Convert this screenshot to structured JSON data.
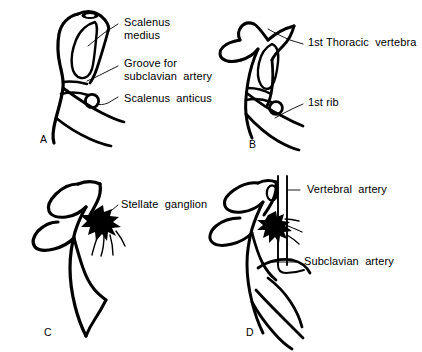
{
  "figure": {
    "background_color": "#ffffff",
    "ink_color": "#000000",
    "panel_count": 4
  },
  "panels": [
    {
      "id": "A",
      "letter": "A",
      "letter_x": 40,
      "letter_y": 133,
      "labels": [
        {
          "name": "scalenus-medius",
          "lines": [
            "Scalenus",
            "medius"
          ],
          "text": "Scalenus\nmedius",
          "x": 124,
          "y": 16
        },
        {
          "name": "groove-for-subclavian-artery",
          "lines": [
            "Groove for",
            "subclavian  artery"
          ],
          "text": "Groove for\nsubclavian  artery",
          "x": 124,
          "y": 57
        },
        {
          "name": "scalenus-anticus",
          "lines": [
            "Scalenus  anticus"
          ],
          "text": "Scalenus  anticus",
          "x": 124,
          "y": 92
        }
      ]
    },
    {
      "id": "B",
      "letter": "B",
      "letter_x": 249,
      "letter_y": 138,
      "labels": [
        {
          "name": "first-thoracic-vertebra",
          "lines": [
            "1st Thoracic  vertebra"
          ],
          "text": "1st Thoracic  vertebra",
          "x": 308,
          "y": 36
        },
        {
          "name": "first-rib",
          "lines": [
            "1st rib"
          ],
          "text": "1st rib",
          "x": 308,
          "y": 96
        }
      ]
    },
    {
      "id": "C",
      "letter": "C",
      "letter_x": 44,
      "letter_y": 326,
      "labels": [
        {
          "name": "stellate-ganglion",
          "lines": [
            "Stellate  ganglion"
          ],
          "text": "Stellate  ganglion",
          "x": 121,
          "y": 198
        }
      ]
    },
    {
      "id": "D",
      "letter": "D",
      "letter_x": 246,
      "letter_y": 326,
      "labels": [
        {
          "name": "vertebral-artery",
          "lines": [
            "Vertebral  artery"
          ],
          "text": "Vertebral  artery",
          "x": 307,
          "y": 183
        },
        {
          "name": "subclavian-artery",
          "lines": [
            "Subclavian  artery"
          ],
          "text": "Subclavian  artery",
          "x": 304,
          "y": 255
        }
      ]
    }
  ]
}
